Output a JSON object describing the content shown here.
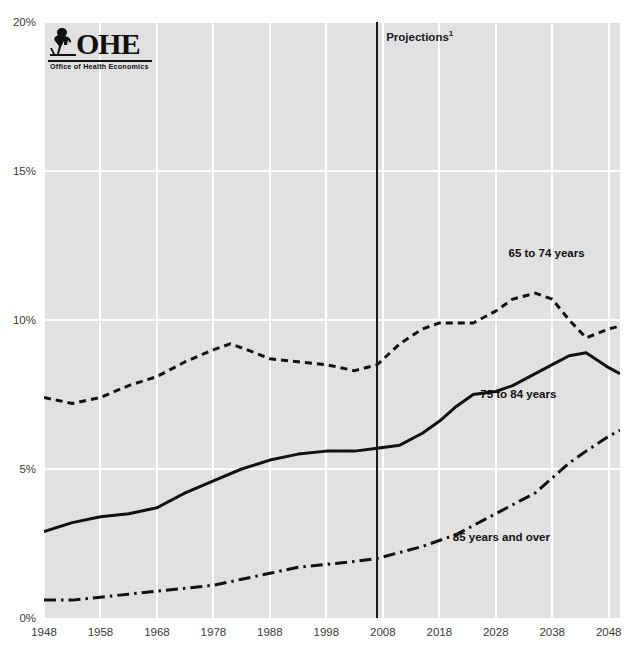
{
  "chart_data": {
    "type": "line",
    "title": "",
    "subtitle": "",
    "xlabel": "",
    "ylabel": "",
    "xlim": [
      1948,
      2050
    ],
    "ylim": [
      0,
      20
    ],
    "y_tick_labels": [
      "0%",
      "5%",
      "10%",
      "15%",
      "20%"
    ],
    "y_ticks": [
      0,
      5,
      10,
      15,
      20
    ],
    "x_tick_labels": [
      "1948",
      "1958",
      "1968",
      "1978",
      "1988",
      "1998",
      "2008",
      "2018",
      "2028",
      "2038",
      "2048"
    ],
    "x_ticks": [
      1948,
      1958,
      1968,
      1978,
      1988,
      1998,
      2008,
      2018,
      2028,
      2038,
      2048
    ],
    "grid": "white gridlines on grey panel, horizontal at 5% intervals and vertical at decade ticks",
    "legend_position": "inline labels at right of each series",
    "unit": "percent of total population",
    "annotations": [
      {
        "text": "Projections",
        "superscript": "1",
        "x": 2007,
        "type": "vertical-divider-label"
      }
    ],
    "projection_divider_year": 2007,
    "series": [
      {
        "name": "65 to 74 years",
        "style": "dotted",
        "color": "#111111",
        "label_x": 2037,
        "label_y": 12.2,
        "x": [
          1948,
          1953,
          1958,
          1963,
          1968,
          1973,
          1978,
          1981,
          1984,
          1988,
          1993,
          1998,
          2003,
          2007,
          2011,
          2015,
          2018,
          2021,
          2024,
          2028,
          2031,
          2035,
          2038,
          2041,
          2044,
          2048,
          2050
        ],
        "values": [
          7.4,
          7.2,
          7.4,
          7.8,
          8.1,
          8.6,
          9.0,
          9.2,
          9.0,
          8.7,
          8.6,
          8.5,
          8.3,
          8.5,
          9.2,
          9.7,
          9.9,
          9.9,
          9.9,
          10.3,
          10.7,
          10.9,
          10.7,
          10.0,
          9.4,
          9.7,
          9.8
        ]
      },
      {
        "name": "75 to 84 years",
        "style": "solid",
        "color": "#111111",
        "label_x": 2032,
        "label_y": 7.5,
        "x": [
          1948,
          1953,
          1958,
          1963,
          1968,
          1973,
          1978,
          1983,
          1988,
          1993,
          1998,
          2003,
          2007,
          2011,
          2015,
          2018,
          2021,
          2024,
          2028,
          2031,
          2035,
          2038,
          2041,
          2044,
          2048,
          2050
        ],
        "values": [
          2.9,
          3.2,
          3.4,
          3.5,
          3.7,
          4.2,
          4.6,
          5.0,
          5.3,
          5.5,
          5.6,
          5.6,
          5.7,
          5.8,
          6.2,
          6.6,
          7.1,
          7.5,
          7.6,
          7.8,
          8.2,
          8.5,
          8.8,
          8.9,
          8.4,
          8.2
        ]
      },
      {
        "name": "85 years and over",
        "style": "dash-dot",
        "color": "#111111",
        "label_x": 2029,
        "label_y": 2.7,
        "x": [
          1948,
          1953,
          1958,
          1963,
          1968,
          1973,
          1978,
          1983,
          1988,
          1993,
          1998,
          2003,
          2007,
          2011,
          2015,
          2018,
          2021,
          2024,
          2028,
          2031,
          2035,
          2038,
          2041,
          2044,
          2048,
          2050
        ],
        "values": [
          0.6,
          0.6,
          0.7,
          0.8,
          0.9,
          1.0,
          1.1,
          1.3,
          1.5,
          1.7,
          1.8,
          1.9,
          2.0,
          2.2,
          2.4,
          2.6,
          2.8,
          3.1,
          3.5,
          3.8,
          4.2,
          4.7,
          5.2,
          5.6,
          6.1,
          6.3
        ]
      }
    ]
  },
  "annotations": {
    "projections_label": "Projections",
    "projections_superscript": "1",
    "top_clipped_text": ""
  },
  "logo": {
    "wordmark": "OHE",
    "tagline": "Office of Health Economics",
    "figure_icon": "seated-scholar-icon"
  },
  "axis": {
    "y_labels": [
      "20%",
      "15%",
      "10%",
      "5%",
      "0%"
    ],
    "x_labels": [
      "1948",
      "1958",
      "1968",
      "1978",
      "1988",
      "1998",
      "2008",
      "2018",
      "2028",
      "2038",
      "2048"
    ]
  },
  "series_labels": {
    "a": "65 to 74 years",
    "b": "75 to 84 years",
    "c": "85 years and over"
  },
  "colors": {
    "panel": "#e3e3e3",
    "grid": "#fdfdfd",
    "ink": "#111111",
    "tick_text": "#3a3a3a"
  }
}
